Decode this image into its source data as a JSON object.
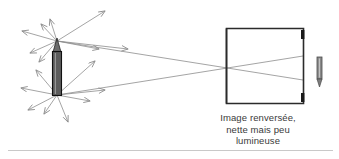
{
  "caption": {
    "line1": "Image renversée,",
    "line2": "nette mais peu",
    "line3": "lumineuse"
  },
  "colors": {
    "ray": "#8d8d8d",
    "box_stroke": "#2b2b2b",
    "object_body": "#5c5c5c",
    "object_outline": "#111111",
    "image_body": "#8a8a8a",
    "caption_text": "#3a3a3a",
    "rule": "#c9c9c9",
    "background": "#ffffff"
  },
  "objects": {
    "pencil_label": "pencil-object",
    "pencil_tip_point": [
      57,
      41
    ],
    "pencil_base_point": [
      57,
      95
    ],
    "inverted_image_label": "inverted-pencil-image",
    "box_label": "pinhole-camera-box",
    "pinhole_point": [
      228,
      70
    ]
  },
  "box": {
    "left": 226,
    "top": 28,
    "right": 304,
    "bottom": 104
  },
  "rays": {
    "tip_fan_count": 8,
    "base_fan_count": 8,
    "principal_ray_count": 2,
    "arrowhead_style": "open-v"
  }
}
